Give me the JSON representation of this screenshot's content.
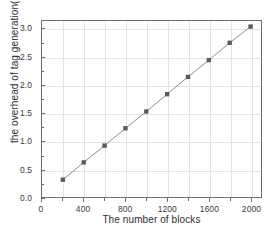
{
  "chart_data": {
    "type": "line",
    "title": "",
    "xlabel": "The number of blocks",
    "ylabel": "the overhead of tag generation(s)",
    "x": [
      200,
      400,
      600,
      800,
      1000,
      1200,
      1400,
      1600,
      1800,
      2000
    ],
    "values": [
      0.31,
      0.62,
      0.92,
      1.23,
      1.53,
      1.84,
      2.15,
      2.45,
      2.76,
      3.05
    ],
    "series": [
      {
        "name": "tag generation overhead",
        "values": [
          0.31,
          0.62,
          0.92,
          1.23,
          1.53,
          1.84,
          2.15,
          2.45,
          2.76,
          3.05
        ]
      }
    ],
    "xlim": [
      0,
      2100
    ],
    "ylim": [
      0.0,
      3.15
    ],
    "xticks": [
      0,
      400,
      800,
      1200,
      1600,
      2000
    ],
    "xtick_labels": [
      "0",
      "400",
      "800",
      "1200",
      "1600",
      "2000"
    ],
    "yticks": [
      0.0,
      0.5,
      1.0,
      1.5,
      2.0,
      2.5,
      3.0
    ],
    "ytick_labels": [
      "0.0",
      "0.5",
      "1.0",
      "1.5",
      "2.0",
      "2.5",
      "3.0"
    ],
    "x_minor_ticks": [
      200,
      600,
      1000,
      1400,
      1800
    ],
    "y_minor_ticks": [
      0.25,
      0.75,
      1.25,
      1.75,
      2.25,
      2.75
    ],
    "grid": true,
    "legend": false,
    "legend_position": "none",
    "marker": "square",
    "marker_color": "#5a5a5a",
    "line_color": "#8a8a8a",
    "grid_color": "#e3e3e3",
    "axis_color": "#6e6e6e",
    "background_color": "#ffffff"
  }
}
